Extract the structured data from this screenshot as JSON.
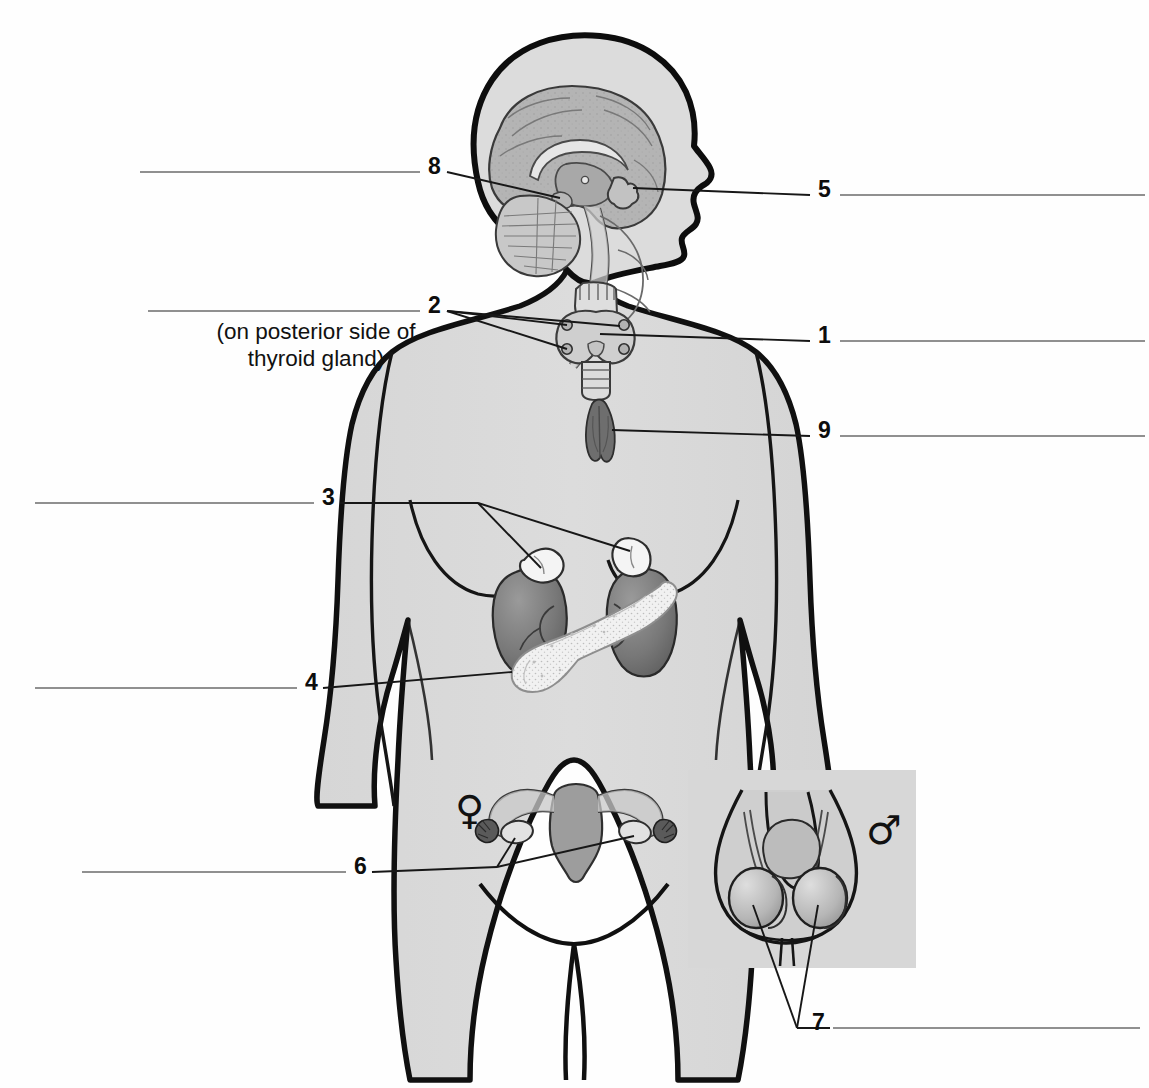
{
  "figure": {
    "kind": "anatomy-worksheet",
    "view": "anterior female body with sagittal head section and male reproductive inset",
    "note_text": "(on posterior side of\nthyroid gland)"
  },
  "symbols": {
    "female": "♀",
    "male": "♂"
  },
  "labels": [
    {
      "id": "label-8",
      "number": "8",
      "side": "left",
      "num_x": 428,
      "num_y": 155,
      "line_y": 172,
      "line_x1": 140,
      "line_x2": 420
    },
    {
      "id": "label-2",
      "number": "2",
      "side": "left",
      "num_x": 428,
      "num_y": 294,
      "line_y": 311,
      "line_x1": 148,
      "line_x2": 420
    },
    {
      "id": "label-3",
      "number": "3",
      "side": "left",
      "num_x": 322,
      "num_y": 486,
      "line_y": 503,
      "line_x1": 35,
      "line_x2": 314
    },
    {
      "id": "label-4",
      "number": "4",
      "side": "left",
      "num_x": 305,
      "num_y": 671,
      "line_y": 688,
      "line_x1": 35,
      "line_x2": 297
    },
    {
      "id": "label-6",
      "number": "6",
      "side": "left",
      "num_x": 354,
      "num_y": 855,
      "line_y": 872,
      "line_x1": 82,
      "line_x2": 346
    },
    {
      "id": "label-5",
      "number": "5",
      "side": "right",
      "num_x": 818,
      "num_y": 178,
      "line_y": 195,
      "line_x1": 840,
      "line_x2": 1145
    },
    {
      "id": "label-1",
      "number": "1",
      "side": "right",
      "num_x": 818,
      "num_y": 324,
      "line_y": 341,
      "line_x1": 840,
      "line_x2": 1145
    },
    {
      "id": "label-9",
      "number": "9",
      "side": "right",
      "num_x": 818,
      "num_y": 419,
      "line_y": 436,
      "line_x1": 840,
      "line_x2": 1145
    },
    {
      "id": "label-7",
      "number": "7",
      "side": "right",
      "num_x": 812,
      "num_y": 1011,
      "line_y": 1028,
      "line_x1": 833,
      "line_x2": 1140
    }
  ],
  "organs": [
    {
      "name": "pituitary-gland",
      "label_number": "5"
    },
    {
      "name": "thyroid-gland",
      "label_number": "1"
    },
    {
      "name": "parathyroid-glands",
      "label_number": "2"
    },
    {
      "name": "adrenal-glands",
      "label_number": "3"
    },
    {
      "name": "pancreas",
      "label_number": "4"
    },
    {
      "name": "ovaries",
      "label_number": "6"
    },
    {
      "name": "testes",
      "label_number": "7"
    },
    {
      "name": "hypothalamus",
      "label_number": "8"
    },
    {
      "name": "thymus",
      "label_number": "9"
    }
  ],
  "colors": {
    "page_background": "#fefefe",
    "body_fill": "#dadada",
    "body_outline": "#101010",
    "brain_fill": "#b4b4b4",
    "cerebellum_fill": "#c8c8c8",
    "kidney_fill": "#777777",
    "pancreas_fill": "#f2f2f2",
    "thymus_fill": "#6e6e6e",
    "uterus_fill": "#9d9d9d",
    "inset_background": "#d7d7d7",
    "leader_line": "#171717",
    "answer_line": "#6b6b6b"
  }
}
